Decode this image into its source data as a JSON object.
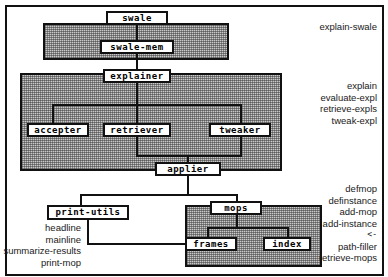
{
  "figure": {
    "background": "#ffffff",
    "frame_color": "#111111",
    "panel_fill": "#c9c9c9"
  },
  "nodes": {
    "swale": "swale",
    "swale_mem": "swale-mem",
    "explainer": "explainer",
    "accepter": "accepter",
    "retriever": "retriever",
    "tweaker": "tweaker",
    "applier": "applier",
    "print_utils": "print-utils",
    "mops": "mops",
    "frames": "frames",
    "index": "index"
  },
  "annotations": {
    "swale_group": [
      "explain-swale"
    ],
    "explainer_group": [
      "explain",
      "evaluate-expl",
      "retrieve-expls",
      "tweak-expl"
    ],
    "print_utils_group": [
      "headline",
      "mainline",
      "summarize-results",
      "print-mop"
    ],
    "mops_group": [
      "defmop",
      "definstance",
      "add-mop",
      "add-instance",
      "<-",
      "path-filler",
      "retrieve-mops"
    ]
  }
}
